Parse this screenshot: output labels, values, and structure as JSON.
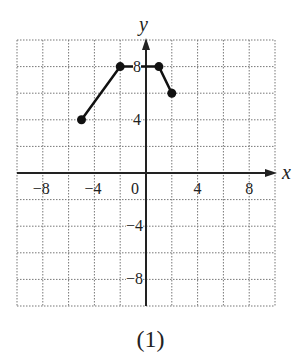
{
  "chart_data": {
    "type": "line",
    "title": "",
    "caption": "(1)",
    "xlabel": "x",
    "ylabel": "y",
    "xlim": [
      -10,
      10
    ],
    "ylim": [
      -10,
      10
    ],
    "grid": true,
    "grid_step": 2,
    "x_ticks": [
      {
        "value": -8,
        "label": "−8"
      },
      {
        "value": -4,
        "label": "−4"
      },
      {
        "value": 0,
        "label": "0"
      },
      {
        "value": 4,
        "label": "4"
      },
      {
        "value": 8,
        "label": "8"
      }
    ],
    "y_ticks": [
      {
        "value": 8,
        "label": "8"
      },
      {
        "value": 4,
        "label": "4"
      },
      {
        "value": -4,
        "label": "−4"
      },
      {
        "value": -8,
        "label": "−8"
      }
    ],
    "series": [
      {
        "name": "graph",
        "points": [
          [
            -5,
            4
          ],
          [
            -2,
            8
          ],
          [
            1,
            8
          ],
          [
            2,
            6
          ]
        ],
        "endpoints_marked": true
      }
    ]
  }
}
